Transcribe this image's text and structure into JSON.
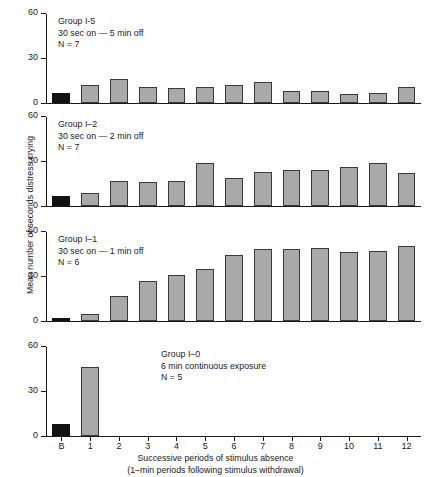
{
  "chart_data": {
    "type": "bar",
    "title": "",
    "xlabel": "Successive periods of stimulus absence",
    "xlabel_line2": "(1–min periods following stimulus withdrawal)",
    "ylabel": "Mean number of seconds distress crying",
    "categories": [
      "B",
      "1",
      "2",
      "3",
      "4",
      "5",
      "6",
      "7",
      "8",
      "9",
      "10",
      "11",
      "12"
    ],
    "ylim": [
      0,
      60
    ],
    "yticks": [
      0,
      30,
      60
    ],
    "ytick_labels": [
      "0",
      "30",
      "60"
    ],
    "grid": false,
    "legend": "none",
    "baseline_category": "B",
    "colors": {
      "baseline_bar": "#121212",
      "bar_fill": "#a9a9a9",
      "bar_edge": "#3a3a3a",
      "axis": "#1a1a1a",
      "background": "#ffffff"
    },
    "panels": [
      {
        "id": "group-i-5",
        "annotation": {
          "line1": "Group I-5",
          "line2": "30 sec on — 5 min off",
          "line3": "N = 7"
        },
        "annotation_position": "left",
        "values": [
          7,
          12,
          16,
          11,
          10,
          11,
          12,
          14,
          8,
          8,
          6,
          7,
          11
        ]
      },
      {
        "id": "group-i-2",
        "annotation": {
          "line1": "Group I–2",
          "line2": "30 sec on — 2 min off",
          "line3": "N = 7"
        },
        "annotation_position": "left",
        "values": [
          7,
          9,
          17,
          16,
          17,
          29,
          19,
          23,
          24,
          24,
          26,
          29,
          22
        ]
      },
      {
        "id": "group-i-1",
        "annotation": {
          "line1": "Group I–1",
          "line2": "30 sec on — 1 min off",
          "line3": "N = 6"
        },
        "annotation_position": "left",
        "values": [
          2,
          5,
          17,
          27,
          31,
          35,
          44,
          48,
          48,
          49,
          46,
          47,
          50
        ]
      },
      {
        "id": "group-i-0",
        "annotation": {
          "line1": "Group I–0",
          "line2": "6 min continuous exposure",
          "line3": "N = 5"
        },
        "annotation_position": "mid",
        "values": [
          8,
          46,
          0,
          0,
          0,
          0,
          0,
          0,
          0,
          0,
          0,
          0,
          0
        ]
      }
    ]
  }
}
